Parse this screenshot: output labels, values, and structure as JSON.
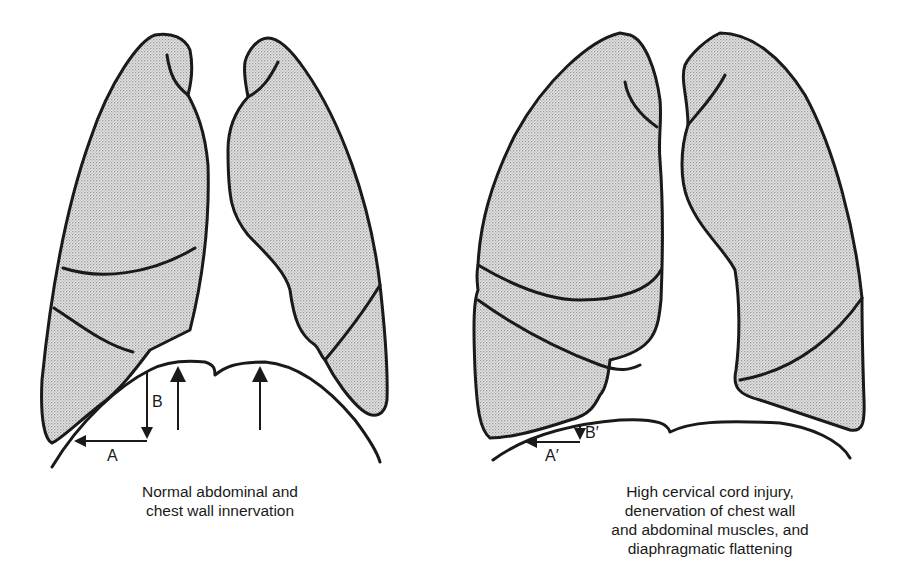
{
  "figure": {
    "left_panel": {
      "caption_lines": [
        "Normal abdominal and",
        "chest wall innervation"
      ],
      "labels": {
        "A": "A",
        "B": "B"
      }
    },
    "right_panel": {
      "caption_lines": [
        "High cervical cord injury,",
        "denervation of chest wall",
        "and abdominal muscles, and",
        "diaphragmatic flattening"
      ],
      "labels": {
        "A": "A′",
        "B": "B′"
      }
    },
    "colors": {
      "stroke": "#1a1a1a",
      "lung_fill": "#d9d9d9",
      "background": "#ffffff"
    }
  }
}
